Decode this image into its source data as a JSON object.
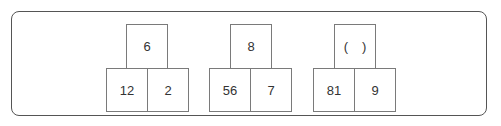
{
  "diagram": {
    "groups": [
      {
        "top": "6",
        "bottom_left": "12",
        "bottom_right": "2"
      },
      {
        "top": "8",
        "bottom_left": "56",
        "bottom_right": "7"
      },
      {
        "top_paren_open": "(",
        "top_paren_close": ")",
        "top": "( )",
        "bottom_left": "81",
        "bottom_right": "9"
      }
    ]
  },
  "colors": {
    "border": "#555555",
    "box_border": "#7a7a7a",
    "text": "#333333"
  }
}
